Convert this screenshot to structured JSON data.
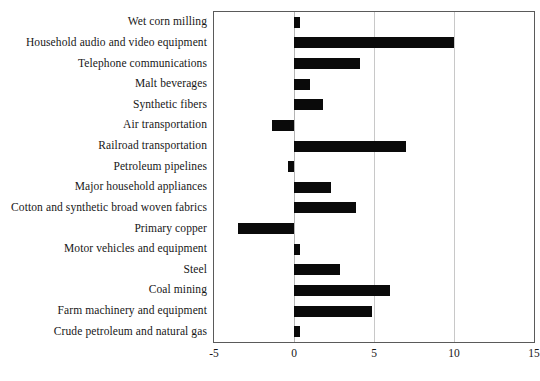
{
  "chart_data": {
    "type": "bar",
    "orientation": "horizontal",
    "title": "",
    "subtitle": "",
    "xlabel": "",
    "ylabel": "",
    "xlim": [
      -5,
      15
    ],
    "ylim": null,
    "grid": true,
    "gridlines_x": [
      -5,
      0,
      5,
      10,
      15
    ],
    "legend": null,
    "legend_position": "none",
    "bar_color": "#0a0a0a",
    "categories": [
      "Wet corn milling",
      "Household audio and video equipment",
      "Telephone communications",
      "Malt beverages",
      "Synthetic fibers",
      "Air transportation",
      "Railroad transportation",
      "Petroleum pipelines",
      "Major household appliances",
      "Cotton and synthetic broad woven fabrics",
      "Primary copper",
      "Motor vehicles and equipment",
      "Steel",
      "Coal mining",
      "Farm machinery and equipment",
      "Crude petroleum and natural gas"
    ],
    "values": [
      0.4,
      10.0,
      4.1,
      1.0,
      1.8,
      -1.4,
      7.0,
      -0.4,
      2.3,
      3.9,
      -3.5,
      0.4,
      2.9,
      6.0,
      4.9,
      0.4
    ],
    "xticks": [
      -5,
      0,
      5,
      10,
      15
    ],
    "xticklabels": [
      "-5",
      "0",
      "5",
      "10",
      "15"
    ]
  }
}
